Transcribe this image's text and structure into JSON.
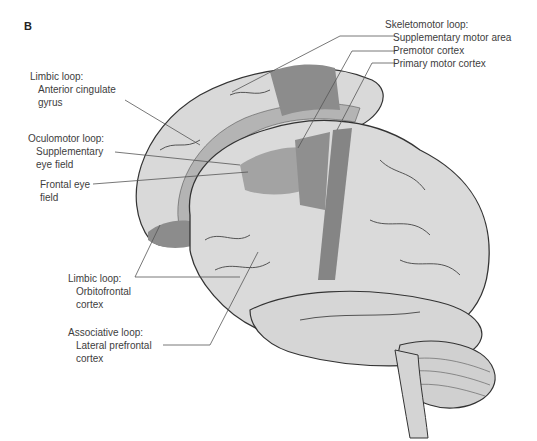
{
  "figure": {
    "panel_letter": "B",
    "colors": {
      "cortex_light": "#dcdcdc",
      "cortex_mid": "#bdbdbd",
      "region_dark": "#8c8c8c",
      "region_mid": "#a6a6a6",
      "outline": "#333333",
      "leader_line": "#555555",
      "text": "#3d3d3d"
    }
  },
  "labels": {
    "skeletomotor": {
      "heading": "Skeletomotor loop:",
      "items": [
        "Supplementary motor area",
        "Premotor cortex",
        "Primary motor cortex"
      ]
    },
    "limbic_acg": {
      "heading": "Limbic loop:",
      "items": [
        "Anterior cingulate",
        "gyrus"
      ]
    },
    "oculomotor": {
      "heading": "Oculomotor loop:",
      "items": [
        "Supplementary",
        "eye field"
      ]
    },
    "frontal_eye": {
      "items": [
        "Frontal eye",
        "field"
      ]
    },
    "limbic_ofc": {
      "heading": "Limbic loop:",
      "items": [
        "Orbitofrontal",
        "cortex"
      ]
    },
    "associative": {
      "heading": "Associative loop:",
      "items": [
        "Lateral prefrontal",
        "cortex"
      ]
    }
  }
}
